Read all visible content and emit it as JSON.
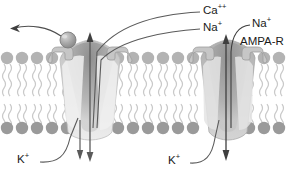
{
  "figure": {
    "type": "biology-diagram",
    "background_color": "#ffffff"
  },
  "labels": {
    "calcium": {
      "text": "Ca",
      "charge": "++",
      "name": "calcium-ion"
    },
    "sodium_left": {
      "text": "Na",
      "charge": "+",
      "name": "sodium-ion-left"
    },
    "sodium_right": {
      "text": "Na",
      "charge": "+",
      "name": "sodium-ion-right"
    },
    "receptor_right": {
      "text": "AMPA-R",
      "name": "ampa-receptor"
    },
    "potassium_left": {
      "text": "K",
      "charge": "+",
      "name": "potassium-ion-left"
    },
    "potassium_right": {
      "text": "K",
      "charge": "+",
      "name": "potassium-ion-right"
    }
  },
  "colors": {
    "stroke": "#4a4a4a",
    "text": "#1a1a1a",
    "lipid_head": "#b3b3b3",
    "lipid_head_dark": "#9a9a9a",
    "lipid_tail": "#cfcfcf",
    "channel_light": "#e9e9e9",
    "channel_mid": "#c9c9c9",
    "channel_dark": "#a5a5a5",
    "pore_shadow": "#8f8f8f",
    "block_sphere": "#a8a8a8",
    "arrow": "#5a5a5a"
  },
  "elements": {
    "left_channel": {
      "name": "nmda-receptor-channel",
      "permeant_ions": [
        "Ca++",
        "Na+",
        "K+"
      ],
      "has_block_sphere": true,
      "block_expelled": true
    },
    "right_channel": {
      "name": "ampa-receptor-channel",
      "permeant_ions": [
        "Na+",
        "K+"
      ],
      "has_block_sphere": false
    },
    "membrane": {
      "name": "lipid-bilayer",
      "leaflets": 2,
      "upper_head_count": 24,
      "lower_head_count": 24
    },
    "flux_arrows": {
      "inward_left": "down",
      "outward_left": "down",
      "inward_right": "down",
      "block_expulsion": "left"
    }
  }
}
